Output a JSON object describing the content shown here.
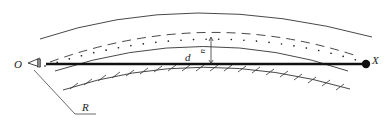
{
  "diagram": {
    "type": "line-of-sight-geometry",
    "labels": {
      "observer": "O",
      "target": "X",
      "distance": "d",
      "offset": "u",
      "radius": "R"
    },
    "elements": [
      "outer-solid-arc",
      "dashed-arc",
      "dotted-ray-path",
      "inner-solid-arc",
      "straight-line-of-sight",
      "hatched-ground-surface",
      "observer-eye",
      "target-point",
      "offset-arrow",
      "radius-leader"
    ],
    "colors": {
      "stroke": "#333333",
      "thick_line": "#111111",
      "background": "#ffffff"
    }
  }
}
